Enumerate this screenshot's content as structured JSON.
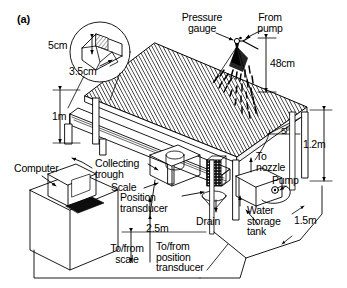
{
  "figure": {
    "panel_label": "(a)",
    "type": "technical-schematic"
  },
  "labels": {
    "pressure_gauge": "Pressure\ngauge",
    "from_pump": "From\npump",
    "nozzle_height": "48cm",
    "inset_top": "5cm",
    "inset_bottom": "3.5cm",
    "plot_height_1m": "1m",
    "slope_angle": "5º",
    "stand_height": "1.2m",
    "computer": "Computer",
    "collecting_trough": "Collecting\ntrough",
    "scale": "Scale",
    "position_transducer": "Position\ntransducer",
    "drain": "Drain",
    "to_nozzle": "To\nnozzle",
    "pump": "Pump",
    "water_storage_tank": "Water\nstorage\ntank",
    "width_1_5m": "1.5m",
    "length_2_5m": "2.5m",
    "to_from_scale": "To/from\nscale",
    "to_from_position_transducer": "To/from\nposition\ntransducer"
  },
  "dimensions": [
    {
      "name": "nozzle-height-above-plot",
      "value": "48cm"
    },
    {
      "name": "inset-upper",
      "value": "5cm"
    },
    {
      "name": "inset-lower",
      "value": "3.5cm"
    },
    {
      "name": "plot-upslope-support-height",
      "value": "1m"
    },
    {
      "name": "plot-slope",
      "value": "5º"
    },
    {
      "name": "frame-height",
      "value": "1.2m"
    },
    {
      "name": "plot-length",
      "value": "2.5m"
    },
    {
      "name": "plot-width",
      "value": "1.5m"
    }
  ],
  "components": [
    "pressure gauge",
    "nozzle",
    "spray fan",
    "soil plot",
    "collecting trough",
    "scale",
    "position transducer",
    "drain",
    "water storage tank",
    "pump",
    "computer"
  ],
  "colors": {
    "line": "#000000",
    "background": "#ffffff",
    "hatch": "#2b2b2b",
    "solid_fill": "#111111"
  }
}
